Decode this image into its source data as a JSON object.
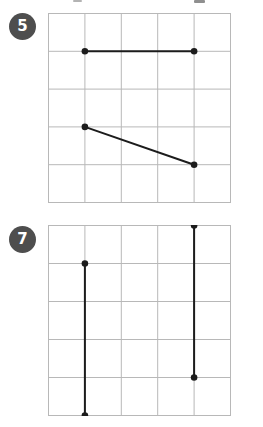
{
  "page": {
    "type": "math-worksheet-grid-exercises",
    "background": "#ffffff"
  },
  "colors": {
    "badge_bg": "#4e4e4e",
    "badge_text": "#ffffff",
    "grid_line": "#b8b8b8",
    "segment": "#1c1c1c"
  },
  "problems": [
    {
      "number": "5",
      "grid": {
        "cols": 5,
        "rows": 5
      },
      "segments": [
        {
          "from": [
            1,
            1
          ],
          "to": [
            4,
            1
          ]
        },
        {
          "from": [
            1,
            3
          ],
          "to": [
            4,
            4
          ]
        }
      ]
    },
    {
      "number": "7",
      "grid": {
        "cols": 5,
        "rows": 5
      },
      "segments": [
        {
          "from": [
            1,
            1
          ],
          "to": [
            1,
            5
          ]
        },
        {
          "from": [
            4,
            0
          ],
          "to": [
            4,
            4
          ]
        }
      ]
    }
  ]
}
